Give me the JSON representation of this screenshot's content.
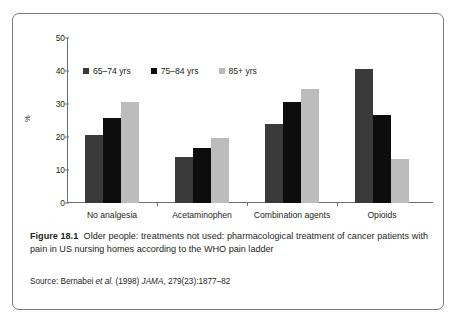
{
  "figure": {
    "label": "Figure 18.1",
    "caption": "Older people: treatments not used: pharmacological treatment of cancer patients with pain in US nursing homes according to the WHO pain ladder",
    "source_prefix": "Source: Bernabei ",
    "source_italic1": "et al.",
    "source_mid": " (1998) ",
    "source_italic2": "JAMA",
    "source_suffix": ", 279(23):1877–82"
  },
  "chart_data": {
    "type": "bar",
    "title": "",
    "xlabel": "",
    "ylabel": "%",
    "ylim": [
      0,
      50
    ],
    "yticks": [
      0,
      10,
      20,
      30,
      40,
      50
    ],
    "grid": false,
    "legend_position": "top-left",
    "categories": [
      "No analgesia",
      "Acetaminophen",
      "Combination agents",
      "Opioids"
    ],
    "series": [
      {
        "name": "65–74 yrs",
        "color": "#3a3a3a",
        "values": [
          20.7,
          13.8,
          23.8,
          40.6
        ]
      },
      {
        "name": "75–84 yrs",
        "color": "#0d0d0d",
        "values": [
          25.7,
          16.6,
          30.5,
          26.6
        ]
      },
      {
        "name": "85+ yrs",
        "color": "#bcbcbc",
        "values": [
          30.6,
          19.6,
          34.5,
          13.4
        ]
      }
    ]
  }
}
